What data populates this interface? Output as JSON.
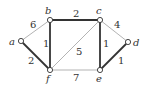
{
  "graph": {
    "nodes": [
      {
        "id": "a",
        "label": "a",
        "x": 21,
        "y": 41,
        "lx": 9,
        "ly": 45
      },
      {
        "id": "b",
        "label": "b",
        "x": 50,
        "y": 20,
        "lx": 45,
        "ly": 14
      },
      {
        "id": "c",
        "label": "c",
        "x": 100,
        "y": 20,
        "lx": 96,
        "ly": 14
      },
      {
        "id": "d",
        "label": "d",
        "x": 128,
        "y": 42,
        "lx": 133,
        "ly": 46
      },
      {
        "id": "e",
        "label": "e",
        "x": 100,
        "y": 70,
        "lx": 96,
        "ly": 82
      },
      {
        "id": "f",
        "label": "f",
        "x": 50,
        "y": 70,
        "lx": 46,
        "ly": 82
      }
    ],
    "edges": [
      {
        "from": "a",
        "to": "b",
        "weight": "6",
        "bold": false,
        "lx": 30,
        "ly": 28
      },
      {
        "from": "b",
        "to": "c",
        "weight": "2",
        "bold": true,
        "lx": 73,
        "ly": 17
      },
      {
        "from": "c",
        "to": "d",
        "weight": "4",
        "bold": false,
        "lx": 114,
        "ly": 28
      },
      {
        "from": "a",
        "to": "f",
        "weight": "2",
        "bold": true,
        "lx": 28,
        "ly": 64
      },
      {
        "from": "b",
        "to": "f",
        "weight": "1",
        "bold": true,
        "lx": 43,
        "ly": 47
      },
      {
        "from": "c",
        "to": "f",
        "weight": "5",
        "bold": false,
        "lx": 76,
        "ly": 55
      },
      {
        "from": "c",
        "to": "e",
        "weight": "1",
        "bold": true,
        "lx": 103,
        "ly": 47
      },
      {
        "from": "f",
        "to": "e",
        "weight": "7",
        "bold": false,
        "lx": 73,
        "ly": 81
      },
      {
        "from": "e",
        "to": "d",
        "weight": "1",
        "bold": true,
        "lx": 118,
        "ly": 64
      }
    ]
  },
  "colors": {
    "thin": "#aaaaaa",
    "bold": "#333333",
    "node_fill": "#ffffff",
    "node_stroke": "#333333"
  }
}
